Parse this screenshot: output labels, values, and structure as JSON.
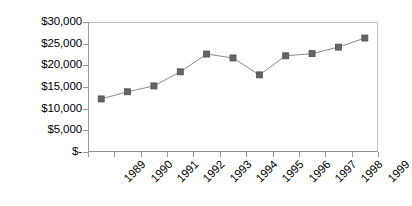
{
  "chart_data": {
    "type": "line",
    "title": "",
    "subtitle": "",
    "xlabel": "",
    "ylabel": "",
    "categories": [
      "1989",
      "1990",
      "1991",
      "1992",
      "1993",
      "1994",
      "1995",
      "1996",
      "1997",
      "1998",
      "1999"
    ],
    "values": [
      12250,
      13900,
      15250,
      18500,
      22600,
      21700,
      17800,
      22200,
      22700,
      24200,
      26300
    ],
    "series": [
      {
        "name": "",
        "values": [
          12250,
          13900,
          15250,
          18500,
          22600,
          21700,
          17800,
          22200,
          22700,
          24200,
          26300
        ]
      }
    ],
    "ylim": [
      0,
      30000
    ],
    "ytick_values": [
      0,
      5000,
      10000,
      15000,
      20000,
      25000,
      30000
    ],
    "ytick_labels": [
      "$-",
      "$5,000",
      "$10,000",
      "$15,000",
      "$20,000",
      "$25,000",
      "$30,000"
    ],
    "grid": false,
    "legend": "none",
    "marker": "square",
    "marker_color": "#666666",
    "line_color": "#8c8c8c",
    "plot_border_color": "#b9b9b9",
    "axis_color": "#9a9a9a",
    "xlabel_rotation": -45
  }
}
